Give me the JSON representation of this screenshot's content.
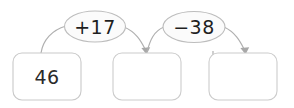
{
  "diagram": {
    "colors": {
      "background": "#ffffff",
      "box_stroke": "#c9c9c9",
      "ellipse_stroke": "#bdbdbd",
      "ellipse_fill": "#fbfbfb",
      "arrow": "#b0b0b0",
      "text": "#2b2b2b",
      "hatch": "#f2f2f2"
    },
    "boxes": [
      {
        "id": "start-box",
        "value": "46",
        "blank": false
      },
      {
        "id": "answer-box-1",
        "value": "",
        "blank": true
      },
      {
        "id": "answer-box-2",
        "value": "",
        "blank": true
      }
    ],
    "operations": [
      {
        "id": "operation-1",
        "label": "+17"
      },
      {
        "id": "operation-2",
        "label": "−38"
      }
    ]
  }
}
